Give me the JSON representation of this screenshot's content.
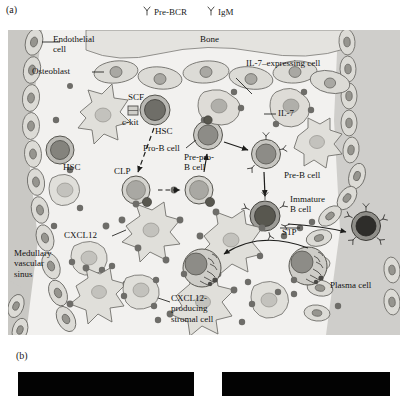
{
  "figure": {
    "panel_a_letter": "(a)",
    "panel_b_letter": "(b)"
  },
  "legend": {
    "items": [
      {
        "icon": "y-shaped-receptor-icon",
        "label": "Pre-BCR"
      },
      {
        "icon": "y-shaped-receptor-icon",
        "label": "IgM"
      }
    ]
  },
  "diagram": {
    "labels": {
      "endothelial_cell": "Endothelial\ncell",
      "bone": "Bone",
      "osteoblast": "Osteoblast",
      "scf": "SCF",
      "c_kit": "c-kit",
      "hsc_top": "HSC",
      "hsc_left": "HSC",
      "il7_expressing_cell": "IL-7–expressing cell",
      "il7": "IL-7",
      "pro_b_cell": "Pro-B cell",
      "clp": "CLP",
      "pre_pro_b_cell": "Pre-pro-\nB cell",
      "pre_b_cell": "Pre-B cell",
      "immature_b_cell": "Immature\nB cell",
      "s1p": "S1P",
      "cxcl12": "CXCL12",
      "cxcl12_producing_stromal_cell": "CXCL12-\nproducing\nstromal cell",
      "medullary_vascular_sinus": "Medullary\nvascular\nsinus",
      "plasma_cell": "Plasma cell"
    },
    "colors": {
      "panel_background": "#f2f1ef",
      "sinus_fill": "#c9c8c4",
      "bone_fill": "#e4e3df",
      "stromal_fill": "#e0dfda",
      "cell_outline": "#6b6a66",
      "nucleus_fill": "#a9a8a3",
      "dark_cell_fill": "#8d8c87",
      "darkest_cell_fill": "#4a4946",
      "chemokine_dot": "#6e6d69",
      "text": "#111111"
    }
  },
  "micrographs": {
    "left": {
      "name": "micrograph-left",
      "appearance": "black"
    },
    "right": {
      "name": "micrograph-right",
      "appearance": "black"
    }
  }
}
